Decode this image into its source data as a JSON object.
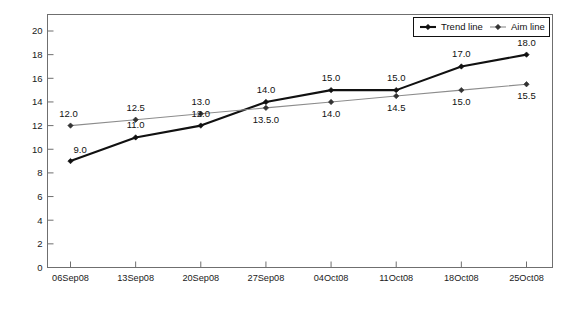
{
  "chart_data": {
    "type": "line",
    "title": "",
    "xlabel": "Dates",
    "ylabel": "WCPM",
    "categories": [
      "06Sep08",
      "13Sep08",
      "20Sep08",
      "27Sep08",
      "04Oct08",
      "11Oct08",
      "18Oct08",
      "25Oct08"
    ],
    "ylim": [
      0,
      20
    ],
    "yticks": [
      0,
      2,
      4,
      6,
      8,
      10,
      12,
      14,
      16,
      18,
      20
    ],
    "grid": false,
    "legend_position": "top-right-inside",
    "series": [
      {
        "name": "Trend line",
        "color": "#111111",
        "values": [
          9.0,
          11.0,
          12.0,
          14.0,
          15.0,
          15.0,
          17.0,
          18.0
        ],
        "labels": [
          "9.0",
          "11.0",
          "12.0",
          "14.0",
          "15.0",
          "15.0",
          "17.0",
          "18.0"
        ]
      },
      {
        "name": "Aim line",
        "color": "#8c8c8c",
        "values": [
          12.0,
          12.5,
          13.0,
          13.5,
          14.0,
          14.5,
          15.0,
          15.5
        ],
        "labels": [
          "12.0",
          "12.5",
          "13.0",
          "13.5.0",
          "14.0",
          "14.5",
          "15.0",
          "15.5"
        ]
      }
    ]
  },
  "legend": {
    "items": [
      {
        "label": "Trend line"
      },
      {
        "label": "Aim line"
      }
    ]
  }
}
